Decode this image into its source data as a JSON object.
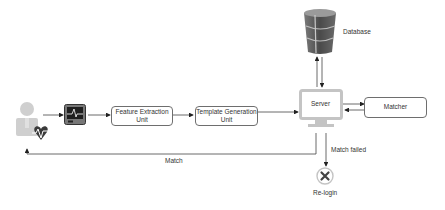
{
  "diagram": {
    "nodes": {
      "user": {
        "icon": "user-heartbeat-icon"
      },
      "sensor": {
        "icon": "ecg-monitor-icon"
      },
      "feature_extraction": {
        "label_line1": "Feature Extraction",
        "label_line2": "Unit"
      },
      "template_generation": {
        "label_line1": "Template Generation",
        "label_line2": "Unit"
      },
      "server": {
        "label": "Server",
        "icon": "monitor-icon"
      },
      "matcher": {
        "label": "Matcher"
      },
      "database": {
        "label": "Database",
        "icon": "database-icon"
      },
      "relogin": {
        "label": "Re-login",
        "icon": "close-circle-icon"
      }
    },
    "edges": {
      "match": "Match",
      "match_failed": "Match failed"
    },
    "colors": {
      "line": "#444444",
      "box_border": "#6e6e6e",
      "icon_gray": "#bdbdbd",
      "heart": "#3a3a3a",
      "db_dark": "#555555"
    }
  }
}
